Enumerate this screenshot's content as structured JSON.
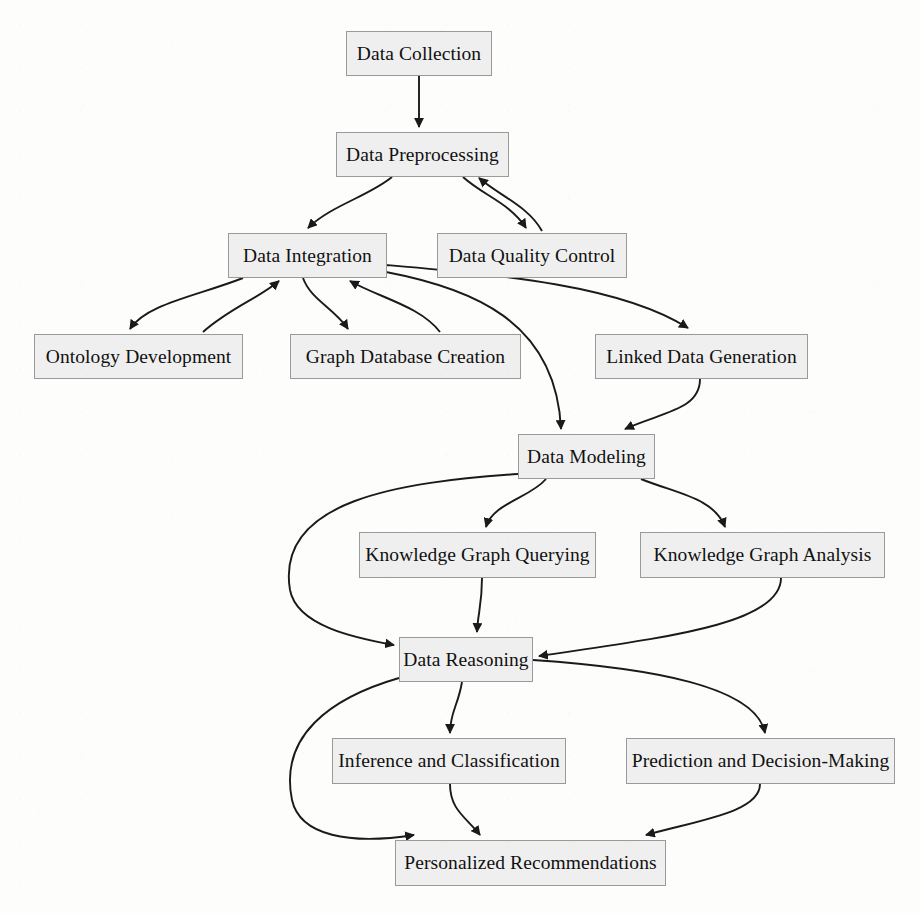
{
  "diagram": {
    "type": "flowchart",
    "orientation": "top-to-bottom",
    "background_color": "#fdfdfc",
    "node_fill_color": "#efefef",
    "node_border_color": "#9a9a9a",
    "edge_color": "#1a1a1a",
    "text_color": "#111111"
  },
  "nodes": [
    {
      "id": "data_collection",
      "label": "Data Collection",
      "x": 346,
      "y": 31,
      "w": 146,
      "h": 45
    },
    {
      "id": "data_preprocessing",
      "label": "Data Preprocessing",
      "x": 336,
      "y": 132,
      "w": 173,
      "h": 45
    },
    {
      "id": "data_integration",
      "label": "Data Integration",
      "x": 228,
      "y": 233,
      "w": 159,
      "h": 45
    },
    {
      "id": "data_quality_control",
      "label": "Data Quality Control",
      "x": 437,
      "y": 233,
      "w": 190,
      "h": 45
    },
    {
      "id": "ontology_development",
      "label": "Ontology Development",
      "x": 34,
      "y": 334,
      "w": 209,
      "h": 45
    },
    {
      "id": "graph_database_creation",
      "label": "Graph Database Creation",
      "x": 290,
      "y": 334,
      "w": 231,
      "h": 45
    },
    {
      "id": "linked_data_generation",
      "label": "Linked Data Generation",
      "x": 595,
      "y": 334,
      "w": 213,
      "h": 45
    },
    {
      "id": "data_modeling",
      "label": "Data Modeling",
      "x": 518,
      "y": 434,
      "w": 137,
      "h": 45
    },
    {
      "id": "kg_querying",
      "label": "Knowledge Graph Querying",
      "x": 359,
      "y": 532,
      "w": 237,
      "h": 46
    },
    {
      "id": "kg_analysis",
      "label": "Knowledge Graph Analysis",
      "x": 640,
      "y": 532,
      "w": 245,
      "h": 46
    },
    {
      "id": "data_reasoning",
      "label": "Data Reasoning",
      "x": 399,
      "y": 637,
      "w": 134,
      "h": 45
    },
    {
      "id": "inference_classification",
      "label": "Inference and Classification",
      "x": 332,
      "y": 738,
      "w": 234,
      "h": 46
    },
    {
      "id": "prediction_decision",
      "label": "Prediction and Decision-Making",
      "x": 626,
      "y": 738,
      "w": 269,
      "h": 46
    },
    {
      "id": "personalized_recs",
      "label": "Personalized Recommendations",
      "x": 395,
      "y": 840,
      "w": 271,
      "h": 46
    }
  ],
  "edges": [
    {
      "from": "data_collection",
      "to": "data_preprocessing",
      "arrow": "end"
    },
    {
      "from": "data_preprocessing",
      "to": "data_integration",
      "arrow": "end"
    },
    {
      "from": "data_preprocessing",
      "to": "data_quality_control",
      "arrow": "end"
    },
    {
      "from": "data_quality_control",
      "to": "data_preprocessing",
      "arrow": "end"
    },
    {
      "from": "data_integration",
      "to": "ontology_development",
      "arrow": "end"
    },
    {
      "from": "ontology_development",
      "to": "data_integration",
      "arrow": "end"
    },
    {
      "from": "data_integration",
      "to": "graph_database_creation",
      "arrow": "end"
    },
    {
      "from": "graph_database_creation",
      "to": "data_integration",
      "arrow": "end"
    },
    {
      "from": "data_integration",
      "to": "linked_data_generation",
      "arrow": "end"
    },
    {
      "from": "data_integration",
      "to": "data_modeling",
      "arrow": "end"
    },
    {
      "from": "linked_data_generation",
      "to": "data_modeling",
      "arrow": "end"
    },
    {
      "from": "data_modeling",
      "to": "kg_querying",
      "arrow": "end"
    },
    {
      "from": "data_modeling",
      "to": "kg_analysis",
      "arrow": "end"
    },
    {
      "from": "data_modeling",
      "to": "data_reasoning",
      "arrow": "end"
    },
    {
      "from": "kg_querying",
      "to": "data_reasoning",
      "arrow": "end"
    },
    {
      "from": "kg_analysis",
      "to": "data_reasoning",
      "arrow": "end"
    },
    {
      "from": "data_reasoning",
      "to": "inference_classification",
      "arrow": "end"
    },
    {
      "from": "data_reasoning",
      "to": "prediction_decision",
      "arrow": "end"
    },
    {
      "from": "data_reasoning",
      "to": "personalized_recs",
      "arrow": "end"
    },
    {
      "from": "inference_classification",
      "to": "personalized_recs",
      "arrow": "end"
    },
    {
      "from": "prediction_decision",
      "to": "personalized_recs",
      "arrow": "end"
    }
  ]
}
